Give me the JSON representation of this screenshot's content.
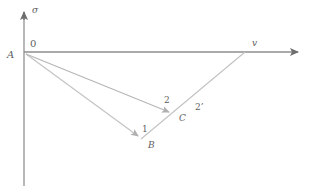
{
  "figure": {
    "type": "vector-diagram",
    "background_color": "#ffffff",
    "axis_color": "#8c8c8c",
    "vector_color": "#b8b8b8",
    "label_color": "#5e5e5e"
  },
  "axes": {
    "vertical": {
      "label": "σ",
      "icon": "up-arrow-axis",
      "x": 24,
      "y_top": 10,
      "y_bottom": 186
    },
    "horizontal": {
      "label": "v",
      "icon": "right-arrow-axis",
      "y": 52,
      "x_start": 24,
      "x_end": 306
    },
    "origin_label": "0"
  },
  "points": [
    {
      "name": "A",
      "label": "A",
      "x": 24,
      "y": 52
    },
    {
      "name": "B",
      "label": "B",
      "x": 141,
      "y": 139
    },
    {
      "name": "C",
      "label": "C",
      "x": 173,
      "y": 115
    },
    {
      "name": "v",
      "label": "v",
      "x": 245,
      "y": 52
    }
  ],
  "vectors": [
    {
      "name": "vector-1",
      "label": "1",
      "from": "A",
      "to": "B",
      "x1": 26,
      "y1": 54,
      "x2": 141,
      "y2": 139
    },
    {
      "name": "vector-2",
      "label": "2",
      "from": "A",
      "to": "C",
      "x1": 26,
      "y1": 54,
      "x2": 173,
      "y2": 115
    }
  ],
  "lines": [
    {
      "name": "line-B-to-v",
      "label": "2'",
      "from": "B",
      "to": "v",
      "x1": 141,
      "y1": 139,
      "x2": 245,
      "y2": 52
    }
  ],
  "labels": {
    "sigma": "σ",
    "zero": "0",
    "A": "A",
    "v": "v",
    "one": "1",
    "B": "B",
    "two": "2",
    "C": "C",
    "two_prime": "2’"
  }
}
